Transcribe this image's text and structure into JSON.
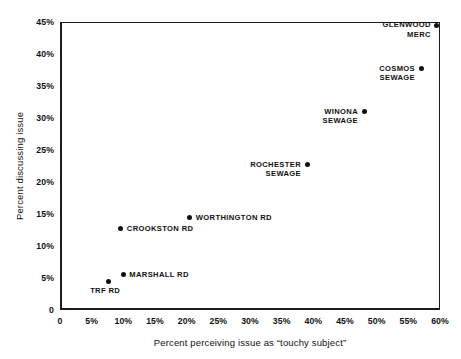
{
  "chart_data": {
    "type": "scatter",
    "title": "",
    "xlabel": "Percent perceiving issue as “touchy subject”",
    "ylabel": "Percent discussing issue",
    "xlim": [
      0,
      60
    ],
    "ylim": [
      0,
      45
    ],
    "grid": false,
    "legend": "none",
    "xticks": [
      "0",
      "5%",
      "10%",
      "15%",
      "20%",
      "25%",
      "30%",
      "35%",
      "40%",
      "45%",
      "50%",
      "55%",
      "60%"
    ],
    "xtick_values": [
      0,
      5,
      10,
      15,
      20,
      25,
      30,
      35,
      40,
      45,
      50,
      55,
      60
    ],
    "yticks": [
      "0",
      "5%",
      "10%",
      "15%",
      "20%",
      "25%",
      "30%",
      "35%",
      "40%",
      "45%"
    ],
    "ytick_values": [
      0,
      5,
      10,
      15,
      20,
      25,
      30,
      35,
      40,
      45
    ],
    "points": [
      {
        "label": "GLENWOOD\nMERC",
        "x": 59.5,
        "y": 44.5,
        "label_side": "left"
      },
      {
        "label": "COSMOS\nSEWAGE",
        "x": 57.0,
        "y": 37.7,
        "label_side": "left"
      },
      {
        "label": "WINONA\nSEWAGE",
        "x": 48.0,
        "y": 31.0,
        "label_side": "left"
      },
      {
        "label": "ROCHESTER\nSEWAGE",
        "x": 39.0,
        "y": 22.7,
        "label_side": "left"
      },
      {
        "label": "WORTHINGTON RD",
        "x": 20.5,
        "y": 14.5,
        "label_side": "right"
      },
      {
        "label": "CROOKSTON RD",
        "x": 9.6,
        "y": 12.7,
        "label_side": "right"
      },
      {
        "label": "MARSHALL RD",
        "x": 10.0,
        "y": 5.5,
        "label_side": "right"
      },
      {
        "label": "TRF RD",
        "x": 7.6,
        "y": 4.5,
        "label_side": "below"
      }
    ],
    "marker_color": "#111111",
    "axis_color": "#1b1b1b",
    "background_color": "#ffffff"
  }
}
